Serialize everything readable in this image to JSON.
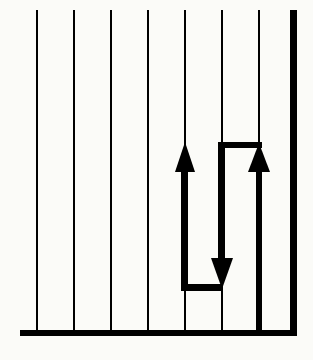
{
  "diagram": {
    "colors": {
      "background": "#fbfbf8",
      "ink": "#000000"
    },
    "thin_lines_x": [
      37,
      74,
      111,
      148,
      185,
      222,
      259
    ],
    "thin_line_top": 10,
    "floor": {
      "x1": 20,
      "x2": 297,
      "y": 333,
      "thickness": 6
    },
    "wall": {
      "x": 293,
      "y1": 10,
      "y2": 336,
      "thickness": 6
    },
    "path": {
      "segments": [
        {
          "name": "up-arrow-left",
          "x": 185,
          "from_y": 288,
          "to_y": 145,
          "direction": "up"
        },
        {
          "name": "bottom-connector",
          "from_x": 185,
          "to_x": 222,
          "y": 288
        },
        {
          "name": "down-arrow-middle",
          "x": 222,
          "from_y": 145,
          "to_y": 288,
          "direction": "down"
        },
        {
          "name": "top-connector",
          "from_x": 222,
          "to_x": 259,
          "y": 145
        },
        {
          "name": "up-arrow-right",
          "x": 259,
          "from_y": 330,
          "to_y": 145,
          "direction": "up"
        }
      ]
    },
    "icons": [
      "arrow-up-icon",
      "arrow-down-icon",
      "arrow-up-icon"
    ]
  }
}
